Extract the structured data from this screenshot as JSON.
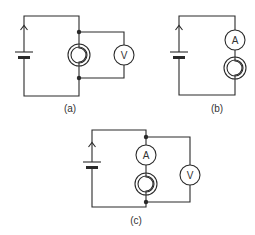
{
  "figure": {
    "colors": {
      "line": "#2a2a2a",
      "background": "#ffffff"
    },
    "circuits": [
      {
        "caption": "(a)",
        "components": [
          "battery",
          "lamp",
          "voltmeter"
        ],
        "meters": [
          {
            "symbol": "V",
            "connection": "parallel across lamp"
          }
        ]
      },
      {
        "caption": "(b)",
        "components": [
          "battery",
          "ammeter",
          "lamp"
        ],
        "meters": [
          {
            "symbol": "A",
            "connection": "series with lamp"
          }
        ]
      },
      {
        "caption": "(c)",
        "components": [
          "battery",
          "ammeter",
          "lamp",
          "voltmeter"
        ],
        "meters": [
          {
            "symbol": "A",
            "connection": "series with lamp"
          },
          {
            "symbol": "V",
            "connection": "parallel across ammeter and lamp"
          }
        ]
      }
    ]
  }
}
